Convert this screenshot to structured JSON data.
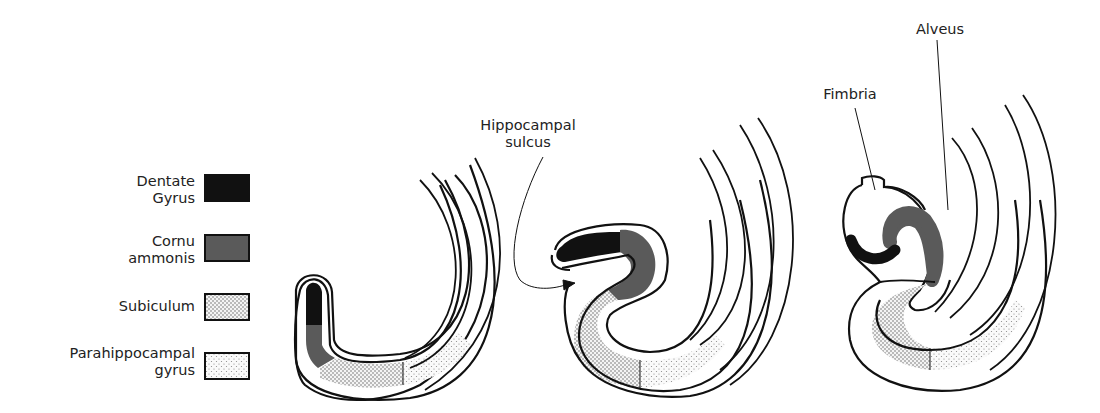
{
  "legend": {
    "items": [
      {
        "label_line1": "Dentate",
        "label_line2": "Gyrus",
        "fill": "#111111",
        "pattern": "solid"
      },
      {
        "label_line1": "Cornu",
        "label_line2": "ammonis",
        "fill": "#5a5a5a",
        "pattern": "solid"
      },
      {
        "label_line1": "Subiculum",
        "label_line2": "",
        "fill": "#d8d8d8",
        "pattern": "dense-dots"
      },
      {
        "label_line1": "Parahippocampal",
        "label_line2": "gyrus",
        "fill": "#efefef",
        "pattern": "sparse-dots"
      }
    ]
  },
  "labels": {
    "hippocampal_sulcus_line1": "Hippocampal",
    "hippocampal_sulcus_line2": "sulcus",
    "fimbria": "Fimbria",
    "alveus": "Alveus"
  },
  "stages": [
    {
      "name": "stage-1",
      "description": "Early C-shaped hippocampal primordium"
    },
    {
      "name": "stage-2",
      "description": "Infolding with hippocampal sulcus"
    },
    {
      "name": "stage-3",
      "description": "Mature configuration with fimbria and alveus"
    }
  ]
}
